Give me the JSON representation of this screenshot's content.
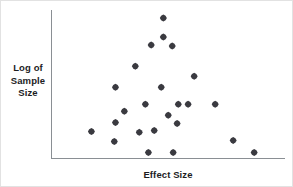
{
  "figure": {
    "name": "funnel-plot",
    "background_color": "#ffffff",
    "border_color": "#e2e2e2",
    "axis_color": "#8a8f94",
    "marker_color": "#3a3a40",
    "text_color": "#1d1d1f"
  },
  "axes": {
    "y_label_lines": [
      "Log of",
      "Sample",
      "Size"
    ],
    "y_label_text": "Log of Sample Size",
    "x_label_text": "Effect Size"
  },
  "chart_data": {
    "type": "scatter",
    "title": "",
    "xlabel": "Effect Size",
    "ylabel": "Log of Sample Size",
    "xlim": [
      0,
      100
    ],
    "ylim": [
      0,
      100
    ],
    "grid": false,
    "legend": "none",
    "x_ticks": [],
    "y_ticks": [],
    "marker": "diamond",
    "marker_size": 5,
    "series": [
      {
        "name": "Studies",
        "points": [
          {
            "x": 47.9,
            "y": 94.6
          },
          {
            "x": 47.9,
            "y": 81.8
          },
          {
            "x": 42.7,
            "y": 76.4
          },
          {
            "x": 51.7,
            "y": 75.7
          },
          {
            "x": 35.9,
            "y": 62.2
          },
          {
            "x": 61.1,
            "y": 55.4
          },
          {
            "x": 27.4,
            "y": 48.0
          },
          {
            "x": 47.0,
            "y": 48.0
          },
          {
            "x": 40.2,
            "y": 36.5
          },
          {
            "x": 54.3,
            "y": 36.5
          },
          {
            "x": 58.5,
            "y": 36.5
          },
          {
            "x": 70.1,
            "y": 36.5
          },
          {
            "x": 50.0,
            "y": 29.1
          },
          {
            "x": 27.4,
            "y": 24.3
          },
          {
            "x": 53.8,
            "y": 23.6
          },
          {
            "x": 17.1,
            "y": 18.2
          },
          {
            "x": 37.6,
            "y": 17.6
          },
          {
            "x": 44.0,
            "y": 18.9
          },
          {
            "x": 26.9,
            "y": 11.5
          },
          {
            "x": 77.8,
            "y": 12.2
          },
          {
            "x": 41.5,
            "y": 4.1
          },
          {
            "x": 52.1,
            "y": 4.1
          },
          {
            "x": 86.8,
            "y": 4.1
          },
          {
            "x": 31.2,
            "y": 31.8
          }
        ]
      }
    ]
  }
}
